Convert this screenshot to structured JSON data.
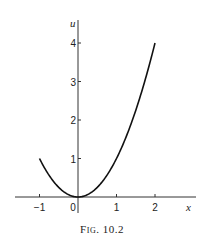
{
  "figure": {
    "caption": "Fig. 10.2"
  },
  "chart_data": {
    "type": "line",
    "title": "",
    "caption": "Fig. 10.2",
    "xlabel": "x",
    "ylabel": "u",
    "x_ticks": [
      "-1",
      "0",
      "1",
      "2"
    ],
    "y_ticks": [
      "1",
      "2",
      "3",
      "4"
    ],
    "xlim": [
      -1.6,
      3.0
    ],
    "ylim": [
      -0.4,
      4.5
    ],
    "grid": false,
    "legend": null,
    "series": [
      {
        "name": "u = x^2",
        "x": [
          -1.0,
          -0.75,
          -0.5,
          -0.25,
          0.0,
          0.25,
          0.5,
          0.75,
          1.0,
          1.25,
          1.5,
          1.75,
          2.0
        ],
        "y": [
          1.0,
          0.5625,
          0.25,
          0.0625,
          0.0,
          0.0625,
          0.25,
          0.5625,
          1.0,
          1.5625,
          2.25,
          3.0625,
          4.0
        ]
      }
    ]
  }
}
